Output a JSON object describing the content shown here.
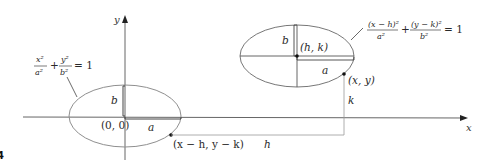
{
  "diagram": {
    "type": "ellipse-translation",
    "axes": {
      "x_label": "x",
      "y_label": "y"
    },
    "origin_ellipse": {
      "equation": {
        "num1": "x²",
        "den1": "a²",
        "plus": "+",
        "num2": "y²",
        "den2": "b²",
        "rhs": "= 1"
      },
      "center_label": "(0, 0)",
      "semi_major_label": "a",
      "semi_minor_label": "b",
      "point_label": "(x − h, y − k)"
    },
    "shifted_ellipse": {
      "equation": {
        "num1": "(x − h)²",
        "den1": "a²",
        "plus": "+",
        "num2": "(y − k)²",
        "den2": "b²",
        "rhs": "= 1"
      },
      "center_label": "(h, k)",
      "semi_major_label": "a",
      "semi_minor_label": "b",
      "point_label": "(x, y)"
    },
    "shift_labels": {
      "horizontal": "h",
      "vertical": "k"
    },
    "figure_number": "4",
    "colors": {
      "ellipse_stroke": "#8a8a8a",
      "axis": "#555555",
      "point": "#111111"
    }
  }
}
